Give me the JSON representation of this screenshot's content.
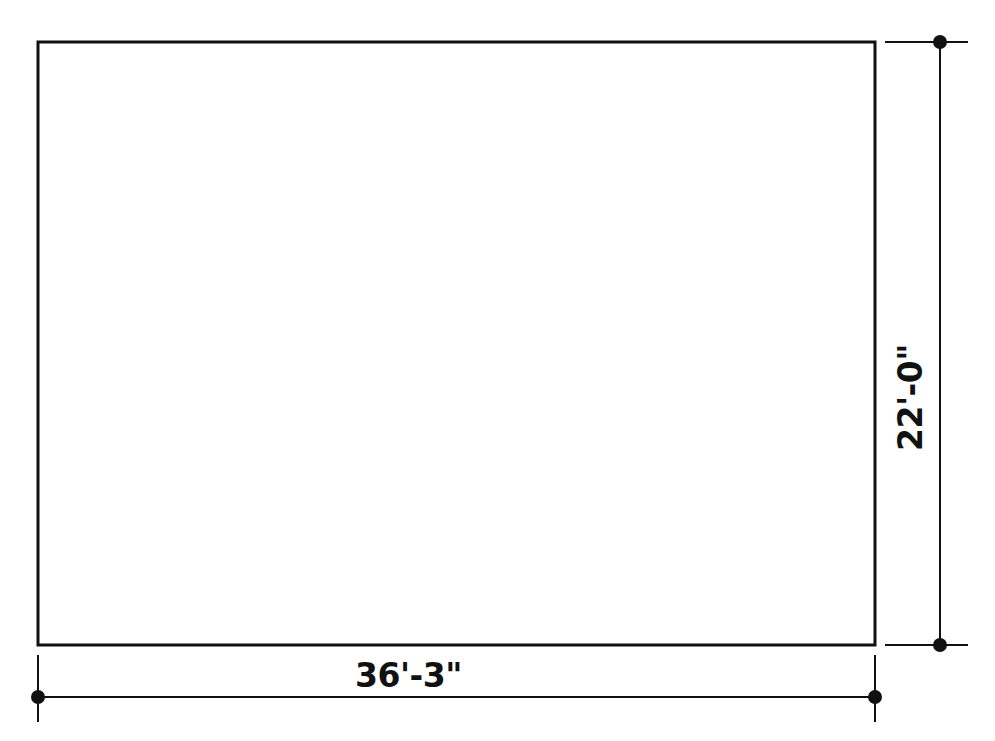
{
  "drawing": {
    "title": "Rectangular floor plan with dimensions",
    "background_color": "#ffffff",
    "line_color": "#111111",
    "shape": {
      "name": "rectangle",
      "x": 38,
      "y": 42,
      "width": 837,
      "height": 603,
      "stroke_width": 3,
      "fill": "none"
    },
    "dimensions": {
      "width": {
        "label": "36'-3\"",
        "feet": 36,
        "inches": 3,
        "orientation": "horizontal",
        "dimension_line_y": 697,
        "start_x": 38,
        "end_x": 875,
        "terminator": "filled-dot"
      },
      "height": {
        "label": "22'-0\"",
        "feet": 22,
        "inches": 0,
        "orientation": "vertical",
        "dimension_line_x": 940,
        "start_y": 42,
        "end_y": 645,
        "terminator": "filled-dot"
      }
    },
    "terminator_dot": {
      "radius": 7,
      "color": "#111111"
    },
    "extension_lines": {
      "stroke_width": 2,
      "color": "#111111",
      "gap": 10
    }
  }
}
